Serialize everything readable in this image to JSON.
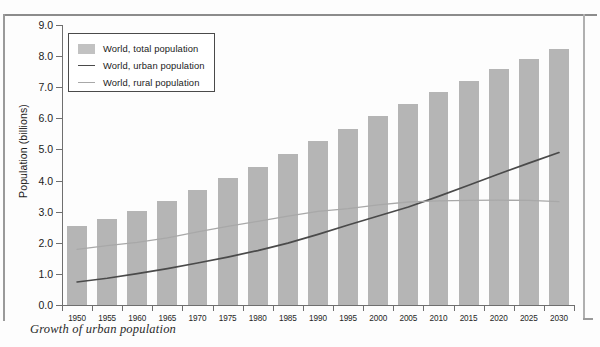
{
  "caption": "Growth of urban population",
  "legend": {
    "position": "top-left",
    "items": [
      {
        "label": "World, total population",
        "marker": "swatch",
        "color": "#c2c2c2"
      },
      {
        "label": "World, urban population",
        "marker": "line",
        "color": "#4a4a4a"
      },
      {
        "label": "World, rural population",
        "marker": "line",
        "color": "#a8a8a8"
      }
    ]
  },
  "chart_data": {
    "type": "bar",
    "title": "",
    "xlabel": "",
    "ylabel": "Population (billions)",
    "ylim": [
      0.0,
      9.0
    ],
    "ytick_step": 1.0,
    "ytick_labels": [
      "0.0",
      "1.0",
      "2.0",
      "3.0",
      "4.0",
      "5.0",
      "6.0",
      "7.0",
      "8.0",
      "9.0"
    ],
    "grid": false,
    "categories": [
      1950,
      1955,
      1960,
      1965,
      1970,
      1975,
      1980,
      1985,
      1990,
      1995,
      2000,
      2005,
      2010,
      2015,
      2020,
      2025,
      2030
    ],
    "category_labels": [
      "1950",
      "1955",
      "1960",
      "1965",
      "1970",
      "1975",
      "1980",
      "1985",
      "1990",
      "1995",
      "2000",
      "2005",
      "2010",
      "2015",
      "2020",
      "2025",
      "2030"
    ],
    "series": [
      {
        "name": "World, total population",
        "type": "bar",
        "color": "#b5b5b5",
        "values": [
          2.53,
          2.77,
          3.02,
          3.33,
          3.7,
          4.07,
          4.44,
          4.85,
          5.28,
          5.67,
          6.08,
          6.46,
          6.84,
          7.21,
          7.58,
          7.92,
          8.22
        ]
      },
      {
        "name": "World, urban population",
        "type": "line",
        "color": "#4a4a4a",
        "values": [
          0.74,
          0.86,
          1.01,
          1.17,
          1.35,
          1.54,
          1.75,
          1.99,
          2.27,
          2.57,
          2.86,
          3.15,
          3.49,
          3.85,
          4.21,
          4.56,
          4.9
        ]
      },
      {
        "name": "World, rural population",
        "type": "line",
        "color": "#a8a8a8",
        "values": [
          1.79,
          1.91,
          2.01,
          2.16,
          2.35,
          2.53,
          2.69,
          2.86,
          3.01,
          3.1,
          3.22,
          3.31,
          3.35,
          3.36,
          3.37,
          3.36,
          3.32
        ]
      }
    ]
  }
}
